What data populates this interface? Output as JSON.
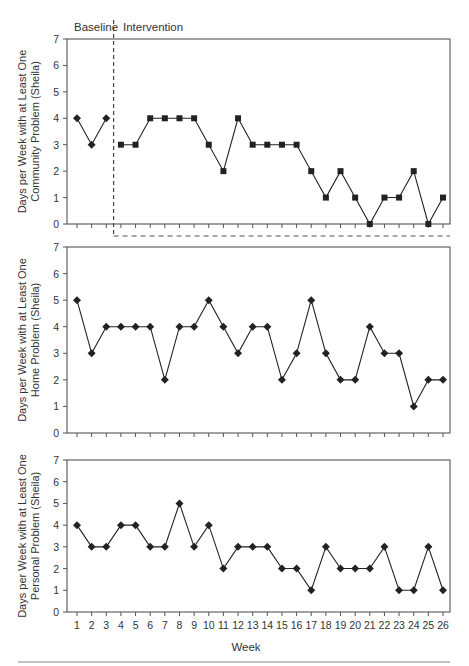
{
  "chart_data": [
    {
      "type": "line",
      "id": "community",
      "ylabel_lines": [
        "Days per Week with at Least One",
        "Community Problem (Sheila)"
      ],
      "ylim": [
        0,
        7
      ],
      "yticks": [
        0,
        1,
        2,
        3,
        4,
        5,
        6,
        7
      ],
      "phase_labels": [
        "Baseline",
        "Intervention"
      ],
      "phase_change_after_week": 3,
      "x": [
        1,
        2,
        3,
        4,
        5,
        6,
        7,
        8,
        9,
        10,
        11,
        12,
        13,
        14,
        15,
        16,
        17,
        18,
        19,
        20,
        21,
        22,
        23,
        24,
        25,
        26
      ],
      "series": [
        {
          "name": "Baseline",
          "marker": "diamond",
          "weeks": [
            1,
            2,
            3
          ],
          "values": [
            4,
            3,
            4
          ]
        },
        {
          "name": "Intervention",
          "marker": "square",
          "weeks": [
            4,
            5,
            6,
            7,
            8,
            9,
            10,
            11,
            12,
            13,
            14,
            15,
            16,
            17,
            18,
            19,
            20,
            21,
            22,
            23,
            24,
            25,
            26
          ],
          "values": [
            3,
            3,
            4,
            4,
            4,
            4,
            3,
            2,
            4,
            3,
            3,
            3,
            3,
            2,
            1,
            2,
            1,
            0,
            1,
            1,
            2,
            0,
            1
          ]
        }
      ],
      "show_xtick_labels": false
    },
    {
      "type": "line",
      "id": "home",
      "ylabel_lines": [
        "Days per Week with at Least One",
        "Home Problem (Sheila)"
      ],
      "ylim": [
        0,
        7
      ],
      "yticks": [
        0,
        1,
        2,
        3,
        4,
        5,
        6,
        7
      ],
      "x": [
        1,
        2,
        3,
        4,
        5,
        6,
        7,
        8,
        9,
        10,
        11,
        12,
        13,
        14,
        15,
        16,
        17,
        18,
        19,
        20,
        21,
        22,
        23,
        24,
        25,
        26
      ],
      "series": [
        {
          "name": "Home",
          "marker": "diamond",
          "weeks": [
            1,
            2,
            3,
            4,
            5,
            6,
            7,
            8,
            9,
            10,
            11,
            12,
            13,
            14,
            15,
            16,
            17,
            18,
            19,
            20,
            21,
            22,
            23,
            24,
            25,
            26
          ],
          "values": [
            5,
            3,
            4,
            4,
            4,
            4,
            2,
            4,
            4,
            5,
            4,
            3,
            4,
            4,
            2,
            3,
            5,
            3,
            2,
            2,
            4,
            3,
            3,
            1,
            2,
            2
          ]
        }
      ],
      "show_xtick_labels": false
    },
    {
      "type": "line",
      "id": "personal",
      "ylabel_lines": [
        "Days per Week with at Least One",
        "Personal Problem (Sheila)"
      ],
      "ylim": [
        0,
        7
      ],
      "yticks": [
        0,
        1,
        2,
        3,
        4,
        5,
        6,
        7
      ],
      "x": [
        1,
        2,
        3,
        4,
        5,
        6,
        7,
        8,
        9,
        10,
        11,
        12,
        13,
        14,
        15,
        16,
        17,
        18,
        19,
        20,
        21,
        22,
        23,
        24,
        25,
        26
      ],
      "series": [
        {
          "name": "Personal",
          "marker": "diamond",
          "weeks": [
            1,
            2,
            3,
            4,
            5,
            6,
            7,
            8,
            9,
            10,
            11,
            12,
            13,
            14,
            15,
            16,
            17,
            18,
            19,
            20,
            21,
            22,
            23,
            24,
            25,
            26
          ],
          "values": [
            4,
            3,
            3,
            4,
            4,
            3,
            3,
            5,
            3,
            4,
            2,
            3,
            3,
            3,
            2,
            2,
            1,
            3,
            2,
            2,
            2,
            3,
            1,
            1,
            3,
            1
          ]
        }
      ],
      "show_xtick_labels": true,
      "xlabel": "Week"
    }
  ],
  "labels": {
    "baseline": "Baseline",
    "intervention": "Intervention",
    "xlabel": "Week"
  },
  "colors": {
    "line": "#222222",
    "axis": "#555555",
    "text": "#333333"
  }
}
